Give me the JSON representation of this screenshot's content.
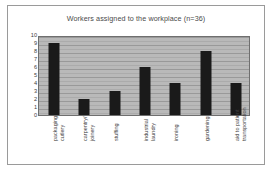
{
  "chart_data": {
    "type": "bar",
    "title": "Workers assigned to the workplace (n=36)",
    "xlabel": "",
    "ylabel": "",
    "ylim": [
      0,
      10
    ],
    "yticks": [
      10,
      9,
      8,
      7,
      6,
      5,
      4,
      3,
      2,
      1,
      0
    ],
    "grid": true,
    "legend": false,
    "categories": [
      "packaging cutlery",
      "carpentry/joinery",
      "stuffing",
      "industrial laundry",
      "ironing",
      "gardening",
      "aid to patient transportation"
    ],
    "category_lines": [
      [
        "packaging",
        "cutlery"
      ],
      [
        "carpentry/",
        "joinery"
      ],
      [
        "stuffing",
        ""
      ],
      [
        "industrial",
        "laundry"
      ],
      [
        "ironing",
        ""
      ],
      [
        "gardening",
        ""
      ],
      [
        "aid to patient",
        "transportation"
      ]
    ],
    "values": [
      9,
      2,
      3,
      6,
      4,
      8,
      4
    ],
    "total": 36,
    "colors": {
      "bar": "#1a1a1a",
      "plot_background": "#b9b9b9",
      "gridline": "#8f8f8f",
      "axis": "#6f6f6f",
      "frame": "#9a9a9a",
      "page_background": "#ffffff",
      "text": "#3f3f3f"
    }
  }
}
